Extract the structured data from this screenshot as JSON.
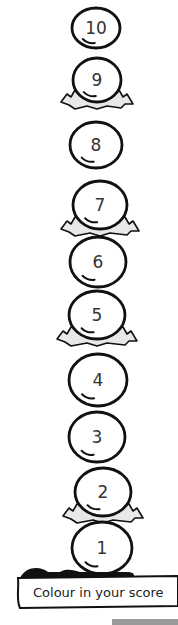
{
  "worksheet": {
    "title": "Colour in your score",
    "banner_label": "Colour in your score",
    "eggs": [
      {
        "label": "10",
        "cx": 96,
        "cy": 28,
        "rx": 24,
        "ry": 20,
        "nest": false
      },
      {
        "label": "9",
        "cx": 97,
        "cy": 80,
        "rx": 24,
        "ry": 22,
        "nest": true
      },
      {
        "label": "8",
        "cx": 96,
        "cy": 145,
        "rx": 26,
        "ry": 23,
        "nest": false
      },
      {
        "label": "7",
        "cx": 100,
        "cy": 205,
        "rx": 27,
        "ry": 24,
        "nest": true
      },
      {
        "label": "6",
        "cx": 98,
        "cy": 262,
        "rx": 28,
        "ry": 25,
        "nest": false
      },
      {
        "label": "5",
        "cx": 97,
        "cy": 315,
        "rx": 28,
        "ry": 24,
        "nest": true
      },
      {
        "label": "4",
        "cx": 98,
        "cy": 380,
        "rx": 29,
        "ry": 26,
        "nest": false
      },
      {
        "label": "3",
        "cx": 97,
        "cy": 437,
        "rx": 28,
        "ry": 25,
        "nest": false
      },
      {
        "label": "2",
        "cx": 103,
        "cy": 492,
        "rx": 28,
        "ry": 24,
        "nest": true
      },
      {
        "label": "1",
        "cx": 102,
        "cy": 548,
        "rx": 30,
        "ry": 26,
        "nest": false
      }
    ],
    "colors": {
      "outline": "#111111",
      "nest_fill": "#e8e8e8",
      "background": "#ffffff",
      "text": "#333333"
    }
  }
}
